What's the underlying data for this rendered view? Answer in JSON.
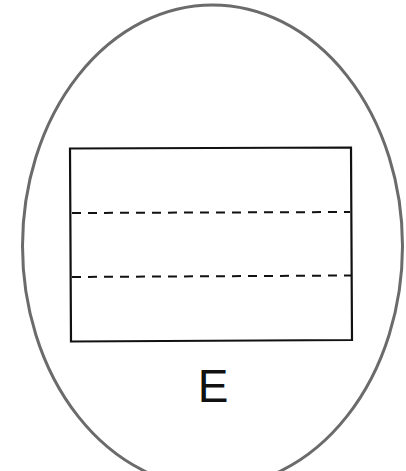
{
  "diagram": {
    "label": "E",
    "oval": {
      "stroke": "#6b6b6b",
      "stroke_width": 3
    },
    "rectangle": {
      "stroke": "#111111",
      "stroke_width": 2.2,
      "dashed_dividers": 2
    },
    "colors": {
      "background": "#ffffff",
      "outline": "#6b6b6b",
      "rect": "#111111"
    }
  }
}
